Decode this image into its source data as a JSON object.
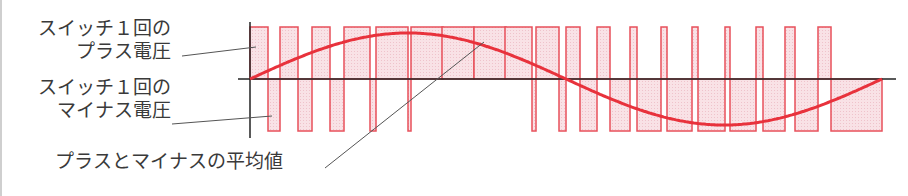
{
  "labels": {
    "plus_voltage_line1": "スイッチ１回の",
    "plus_voltage_line2": "プラス電圧",
    "minus_voltage_line1": "スイッチ１回の",
    "minus_voltage_line2": "マイナス電圧",
    "average": "プラスとマイナスの平均値"
  },
  "colors": {
    "pulse_stroke": "#e8505b",
    "pulse_fill": "#f8dde2",
    "sine": "#e8323c",
    "axis": "#222222",
    "leader": "#555555",
    "text": "#3a3a3a"
  },
  "geometry": {
    "axis_x": 250,
    "zero_y": 79,
    "top_y": 27,
    "bottom_y": 131,
    "end_x": 882,
    "positive_pulses": [
      [
        250,
        268
      ],
      [
        280,
        298
      ],
      [
        312,
        330
      ],
      [
        344,
        370
      ],
      [
        376,
        408
      ],
      [
        411,
        443
      ],
      [
        442,
        474
      ],
      [
        474,
        506
      ],
      [
        505,
        532
      ],
      [
        536,
        559
      ],
      [
        566,
        580
      ],
      [
        597,
        610
      ],
      [
        630,
        637
      ],
      [
        661,
        667
      ],
      [
        692,
        698
      ],
      [
        725,
        730
      ],
      [
        756,
        763
      ],
      [
        785,
        795
      ],
      [
        818,
        831
      ]
    ],
    "sine_amplitude": 46
  }
}
